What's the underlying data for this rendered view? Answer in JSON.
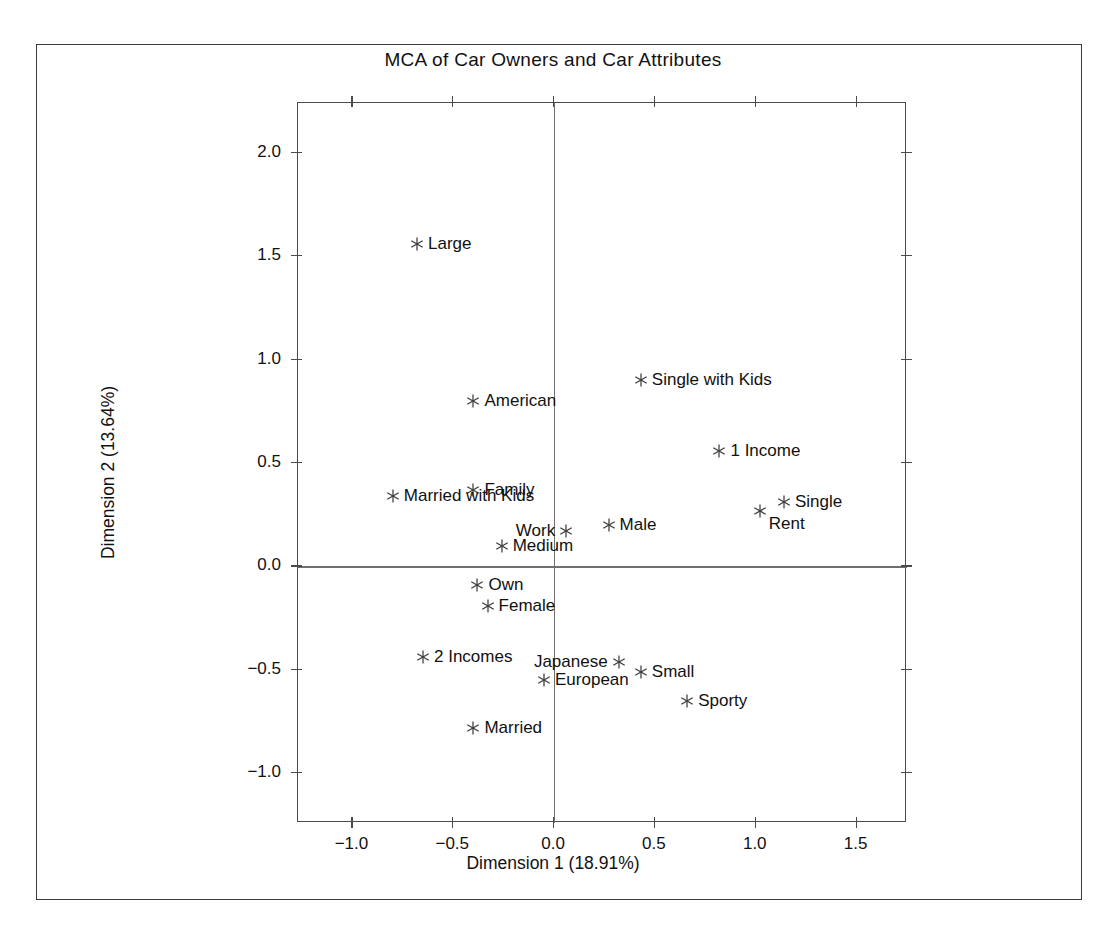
{
  "chart_data": {
    "type": "scatter",
    "title": "MCA of Car Owners and Car Attributes",
    "xlabel": "Dimension 1 (18.91%)",
    "ylabel": "Dimension 2 (13.64%)",
    "xlim": [
      -1.27,
      1.75
    ],
    "ylim": [
      -1.24,
      2.24
    ],
    "xticks": [
      -1.0,
      -0.5,
      0.0,
      0.5,
      1.0,
      1.5
    ],
    "xticklabels": [
      "−1.0",
      "−0.5",
      "0.0",
      "0.5",
      "1.0",
      "1.5"
    ],
    "yticks": [
      2.0,
      1.5,
      1.0,
      0.5,
      0.0,
      -0.5,
      -1.0
    ],
    "yticklabels": [
      "2.0",
      "1.5",
      "1.0",
      "0.5",
      "0.0",
      "−0.5",
      "−1.0"
    ],
    "grid": false,
    "legend": "none",
    "marker": "asterisk",
    "reference_lines": {
      "x": 0.0,
      "y": 0.0
    },
    "points": [
      {
        "label": "Large",
        "x": -0.68,
        "y": 1.56,
        "label_pos": "right"
      },
      {
        "label": "Single with Kids",
        "x": 0.43,
        "y": 0.9,
        "label_pos": "right"
      },
      {
        "label": "American",
        "x": -0.4,
        "y": 0.8,
        "label_pos": "right"
      },
      {
        "label": "1 Income",
        "x": 0.82,
        "y": 0.56,
        "label_pos": "right"
      },
      {
        "label": "Family",
        "x": -0.4,
        "y": 0.37,
        "label_pos": "right"
      },
      {
        "label": "Married with Kids",
        "x": -0.8,
        "y": 0.34,
        "label_pos": "right"
      },
      {
        "label": "Single",
        "x": 1.14,
        "y": 0.31,
        "label_pos": "right"
      },
      {
        "label": "Rent",
        "x": 1.02,
        "y": 0.27,
        "label_pos": "below-right"
      },
      {
        "label": "Male",
        "x": 0.27,
        "y": 0.2,
        "label_pos": "right"
      },
      {
        "label": "Work",
        "x": 0.06,
        "y": 0.17,
        "label_pos": "left"
      },
      {
        "label": "Medium",
        "x": -0.26,
        "y": 0.1,
        "label_pos": "right"
      },
      {
        "label": "Own",
        "x": -0.38,
        "y": -0.09,
        "label_pos": "right"
      },
      {
        "label": "Female",
        "x": -0.33,
        "y": -0.19,
        "label_pos": "right"
      },
      {
        "label": "2 Incomes",
        "x": -0.65,
        "y": -0.44,
        "label_pos": "right"
      },
      {
        "label": "Japanese",
        "x": 0.32,
        "y": -0.46,
        "label_pos": "left"
      },
      {
        "label": "Small",
        "x": 0.43,
        "y": -0.51,
        "label_pos": "right"
      },
      {
        "label": "European",
        "x": -0.05,
        "y": -0.55,
        "label_pos": "right"
      },
      {
        "label": "Sporty",
        "x": 0.66,
        "y": -0.65,
        "label_pos": "right"
      },
      {
        "label": "Married",
        "x": -0.4,
        "y": -0.78,
        "label_pos": "right"
      }
    ]
  }
}
